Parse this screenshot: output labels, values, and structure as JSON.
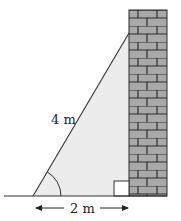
{
  "diagram": {
    "hypotenuse_label": "4 m",
    "base_label": "2 m",
    "colors": {
      "triangle_fill": "#ececec",
      "brick": "#a9a9a9",
      "mortar": "#2b2b2b",
      "line": "#333333"
    },
    "elements": {
      "wall": "brick wall",
      "ladder": "ladder leaning against wall",
      "angle_marker": "angle at ground",
      "right_angle_marker": "right angle at wall base",
      "dimension_arrow": "base distance arrow"
    }
  }
}
